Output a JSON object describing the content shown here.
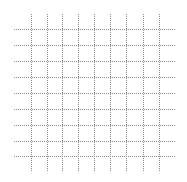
{
  "canvas": {
    "width": 187,
    "height": 182,
    "background": "#ffffff"
  },
  "grid": {
    "line_color": "#8a8a8a",
    "line_style": "dotted",
    "vertical_lines_x": [
      31,
      47,
      62,
      78,
      94,
      110,
      126,
      143,
      159
    ],
    "vertical_extent_y": [
      14,
      172
    ],
    "horizontal_lines_y": [
      29,
      45,
      61,
      77,
      93,
      109,
      125,
      141,
      156
    ],
    "horizontal_extent_x": [
      14,
      175
    ]
  }
}
